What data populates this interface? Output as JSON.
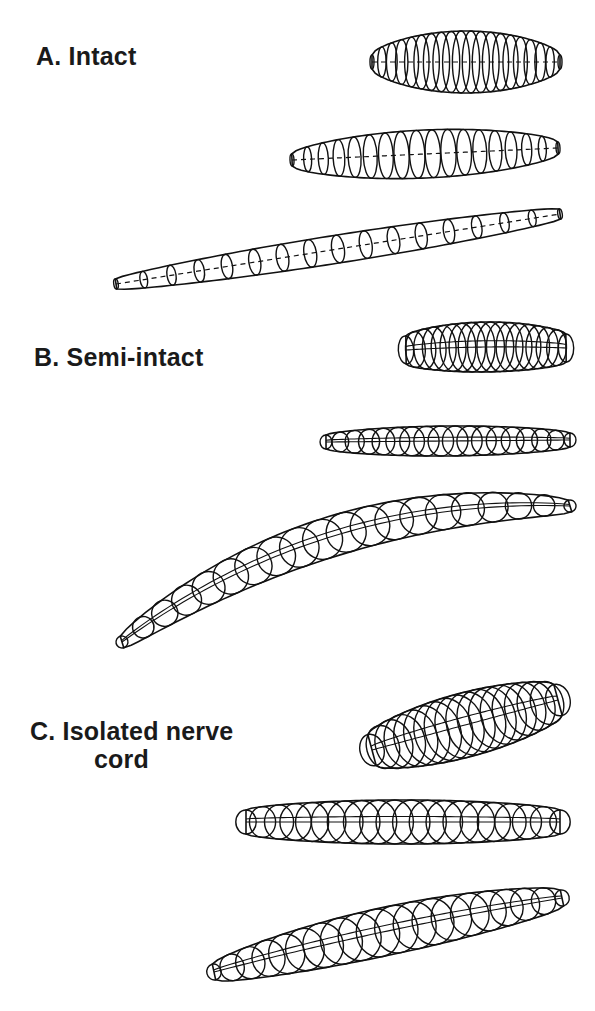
{
  "figure": {
    "panels": [
      {
        "id": "A",
        "label": "A. Intact",
        "label_pos": [
          36,
          42
        ],
        "shapes": [
          {
            "name": "intact-contracted",
            "style": "dashed-axis",
            "start": [
              372,
              62
            ],
            "end": [
              560,
              62
            ],
            "bend": 0,
            "rings": 18,
            "max_r": 31,
            "end_r": 7,
            "ring_aspect": 0.28
          },
          {
            "name": "intact-intermediate",
            "style": "dashed-axis",
            "start": [
              292,
              160
            ],
            "end": [
              558,
              148
            ],
            "bend": 0,
            "rings": 16,
            "max_r": 24,
            "end_r": 6,
            "ring_aspect": 0.32
          },
          {
            "name": "intact-extended",
            "style": "dashed-axis",
            "start": [
              116,
              284
            ],
            "end": [
              560,
              214
            ],
            "bend": 0,
            "rings": 15,
            "max_r": 14,
            "end_r": 5,
            "ring_aspect": 0.45
          }
        ]
      },
      {
        "id": "B",
        "label": "B. Semi-intact",
        "label_pos": [
          34,
          343
        ],
        "shapes": [
          {
            "name": "semi-intact-contracted",
            "style": "solid-axis",
            "start": [
              406,
              350
            ],
            "end": [
              566,
              348
            ],
            "bend": -2,
            "rings": 16,
            "max_r": 25,
            "end_r": 14,
            "ring_aspect": 0.55,
            "skew": -6
          },
          {
            "name": "semi-intact-intermediate",
            "style": "solid-axis",
            "start": [
              326,
              442
            ],
            "end": [
              570,
              440
            ],
            "bend": 0,
            "rings": 16,
            "max_r": 15,
            "end_r": 7,
            "ring_aspect": 0.85
          },
          {
            "name": "semi-intact-extended",
            "style": "solid-axis",
            "start": [
              122,
              642
            ],
            "end": [
              570,
              506
            ],
            "bend": -40,
            "rings": 18,
            "max_r": 20,
            "end_r": 6,
            "ring_aspect": 1.0
          }
        ]
      },
      {
        "id": "C",
        "label": "C. Isolated nerve cord",
        "label_line1": "C. Isolated nerve",
        "label_line2": "cord",
        "label_pos": [
          30,
          717
        ],
        "shapes": [
          {
            "name": "nerve-cord-contracted",
            "style": "solid-axis",
            "start": [
              372,
              750
            ],
            "end": [
              558,
              700
            ],
            "bend": 0,
            "rings": 16,
            "max_r": 32,
            "end_r": 16,
            "ring_aspect": 0.75,
            "skew": 0
          },
          {
            "name": "nerve-cord-intermediate",
            "style": "solid-axis",
            "start": [
              246,
              822
            ],
            "end": [
              560,
              822
            ],
            "bend": 0,
            "rings": 18,
            "max_r": 22,
            "end_r": 12,
            "ring_aspect": 0.85
          },
          {
            "name": "nerve-cord-extended",
            "style": "solid-axis",
            "start": [
              214,
              972
            ],
            "end": [
              562,
              898
            ],
            "bend": -4,
            "rings": 18,
            "max_r": 24,
            "end_r": 8,
            "ring_aspect": 0.9
          }
        ]
      }
    ]
  },
  "colors": {
    "ink": "#111111",
    "background": "#ffffff"
  }
}
